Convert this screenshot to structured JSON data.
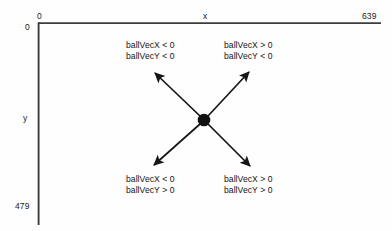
{
  "diagram": {
    "axes": {
      "x_axis_label": "x",
      "y_axis_label": "y",
      "origin_x_tick": "0",
      "origin_y_tick": "0",
      "x_max_tick": "639",
      "y_max_tick": "479"
    },
    "center_point": {
      "label": "",
      "x": 204,
      "y": 120
    },
    "quadrant_labels": [
      {
        "position": "top-left",
        "line1": "ballVecX < 0",
        "line2": "ballVecY < 0"
      },
      {
        "position": "top-right",
        "line1": "ballVecX > 0",
        "line2": "ballVecY < 0"
      },
      {
        "position": "bottom-left",
        "line1": "ballVecX < 0",
        "line2": "ballVecY > 0"
      },
      {
        "position": "bottom-right",
        "line1": "ballVecX > 0",
        "line2": "ballVecY > 0"
      }
    ],
    "arrows": [
      {
        "name": "arrow-up-left",
        "from": [
          204,
          120
        ],
        "to": [
          152,
          70
        ]
      },
      {
        "name": "arrow-up-right",
        "from": [
          204,
          120
        ],
        "to": [
          252,
          69
        ]
      },
      {
        "name": "arrow-down-left",
        "from": [
          204,
          120
        ],
        "to": [
          151,
          168
        ]
      },
      {
        "name": "arrow-down-right",
        "from": [
          204,
          120
        ],
        "to": [
          253,
          169
        ]
      }
    ],
    "colors": {
      "ink": "#1b1b1b",
      "axis": "#3a3a3a",
      "background": "#fefefe"
    }
  }
}
